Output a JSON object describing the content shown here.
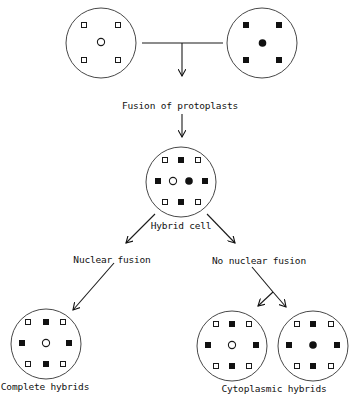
{
  "labels": {
    "fusion": "Fusion of protoplasts",
    "hybrid_cell": "Hybrid cell",
    "nuclear_fusion": "Nuclear fusion",
    "no_nuclear_fusion": "No nuclear fusion",
    "complete_hybrids": "Complete hybrids",
    "cytoplasmic_hybrids": "Cytoplasmic hybrids"
  },
  "cells": [
    {
      "id": "parent-a",
      "name": "Parent protoplast A",
      "nucleus": "open",
      "organelles": "open-squares"
    },
    {
      "id": "parent-b",
      "name": "Parent protoplast B",
      "nucleus": "filled",
      "organelles": "filled-squares"
    },
    {
      "id": "hybrid",
      "name": "Hybrid cell",
      "nuclei": [
        "open",
        "filled"
      ],
      "organelles": "mixed"
    },
    {
      "id": "complete",
      "name": "Complete hybrid",
      "nucleus": "open",
      "organelles": "mixed"
    },
    {
      "id": "cyto-a",
      "name": "Cytoplasmic hybrid A",
      "nucleus": "open",
      "organelles": "mixed"
    },
    {
      "id": "cyto-b",
      "name": "Cytoplasmic hybrid B",
      "nucleus": "filled",
      "organelles": "mixed"
    }
  ],
  "colors": {
    "ink": "#111111",
    "background": "#ffffff"
  }
}
